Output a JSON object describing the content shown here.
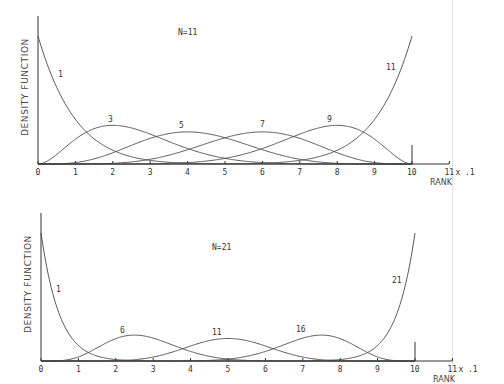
{
  "chart_data": [
    {
      "type": "line",
      "title": "N=11",
      "xlabel": "RANK",
      "x_multiplier_label": "x .1",
      "ylabel": "DENSITY FUNCTION",
      "x_ticks": [
        "0",
        "1",
        "2",
        "3",
        "4",
        "5",
        "6",
        "7",
        "8",
        "9",
        "10",
        "11"
      ],
      "xlim": [
        0,
        11
      ],
      "grid": false,
      "legend": "none (curves labeled inline)",
      "description": "Density functions of the k-th order statistic (rank) of N=11 uniform samples, Beta(k, N-k+1), x in units of 0.1",
      "series": [
        {
          "name": "1",
          "k": 1,
          "peak_x": 0.0,
          "label_pos": [
            58,
            77
          ]
        },
        {
          "name": "3",
          "k": 3,
          "peak_x": 2.0,
          "label_pos": [
            108,
            122
          ]
        },
        {
          "name": "5",
          "k": 5,
          "peak_x": 4.0,
          "label_pos": [
            179,
            128
          ]
        },
        {
          "name": "7",
          "k": 7,
          "peak_x": 6.0,
          "label_pos": [
            260,
            127
          ]
        },
        {
          "name": "9",
          "k": 9,
          "peak_x": 8.0,
          "label_pos": [
            327,
            122
          ]
        },
        {
          "name": "11",
          "k": 11,
          "peak_x": 10.0,
          "label_pos": [
            386,
            70
          ]
        }
      ],
      "frame": {
        "x0": 38,
        "x10": 412,
        "base": 164,
        "top": 16,
        "title_pos": [
          178,
          35
        ],
        "max_density_px": 128
      },
      "N": 11
    },
    {
      "type": "line",
      "title": "N=21",
      "xlabel": "RANK",
      "x_multiplier_label": "x .1",
      "ylabel": "DENSITY FUNCTION",
      "x_ticks": [
        "0",
        "1",
        "2",
        "3",
        "4",
        "5",
        "6",
        "7",
        "8",
        "9",
        "10",
        "11"
      ],
      "xlim": [
        0,
        11
      ],
      "grid": false,
      "legend": "none (curves labeled inline)",
      "description": "Density functions of the k-th order statistic (rank) of N=21 uniform samples, Beta(k, N-k+1), x in units of 0.1",
      "series": [
        {
          "name": "1",
          "k": 1,
          "peak_x": 0.0,
          "label_pos": [
            56,
            292
          ]
        },
        {
          "name": "6",
          "k": 6,
          "peak_x": 2.5,
          "label_pos": [
            120,
            333
          ]
        },
        {
          "name": "11",
          "k": 11,
          "peak_x": 5.0,
          "label_pos": [
            212,
            335
          ]
        },
        {
          "name": "16",
          "k": 16,
          "peak_x": 7.5,
          "label_pos": [
            296,
            332
          ]
        },
        {
          "name": "21",
          "k": 21,
          "peak_x": 10.0,
          "label_pos": [
            392,
            283
          ]
        }
      ],
      "frame": {
        "x0": 41,
        "x10": 415,
        "base": 361,
        "top": 213,
        "title_pos": [
          212,
          250
        ],
        "max_density_px": 128
      },
      "N": 21
    }
  ],
  "labels": {
    "top": {
      "title": "N=11",
      "ylabel": "DENSITY FUNCTION",
      "xlabel": "RANK",
      "mult": "x .1"
    },
    "bottom": {
      "title": "N=21",
      "ylabel": "DENSITY FUNCTION",
      "xlabel": "RANK",
      "mult": "x .1"
    }
  }
}
